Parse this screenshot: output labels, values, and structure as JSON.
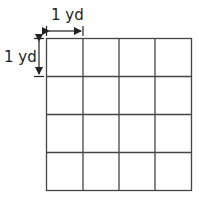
{
  "diagram": {
    "type": "grid",
    "rows": 4,
    "columns": 4,
    "unit_width_label": "1 yd",
    "unit_height_label": "1 yd",
    "line_color": "#444444"
  }
}
